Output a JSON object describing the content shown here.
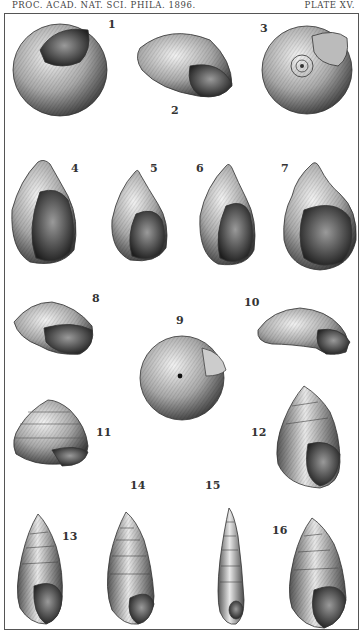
{
  "header": {
    "journal": "PROC. ACAD. NAT. SCI. PHILA. 1896.",
    "plate": "PLATE XV."
  },
  "figures": [
    {
      "n": "1",
      "x": 108,
      "y": 18
    },
    {
      "n": "2",
      "x": 171,
      "y": 104
    },
    {
      "n": "3",
      "x": 260,
      "y": 22
    },
    {
      "n": "4",
      "x": 71,
      "y": 162
    },
    {
      "n": "5",
      "x": 150,
      "y": 162
    },
    {
      "n": "6",
      "x": 196,
      "y": 162
    },
    {
      "n": "7",
      "x": 281,
      "y": 162
    },
    {
      "n": "8",
      "x": 92,
      "y": 292
    },
    {
      "n": "9",
      "x": 176,
      "y": 314
    },
    {
      "n": "10",
      "x": 244,
      "y": 296
    },
    {
      "n": "11",
      "x": 96,
      "y": 426
    },
    {
      "n": "12",
      "x": 251,
      "y": 426
    },
    {
      "n": "13",
      "x": 62,
      "y": 530
    },
    {
      "n": "14",
      "x": 130,
      "y": 479
    },
    {
      "n": "15",
      "x": 205,
      "y": 479
    },
    {
      "n": "16",
      "x": 272,
      "y": 524
    }
  ]
}
